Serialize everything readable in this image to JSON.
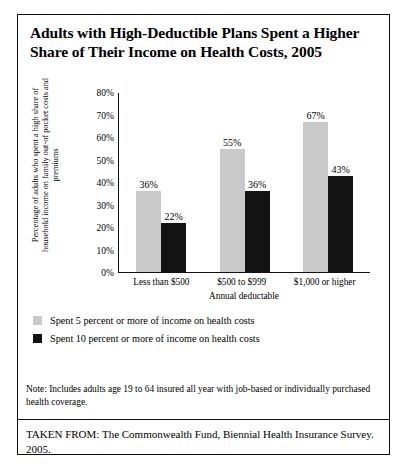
{
  "title": "Adults with High-Deductible Plans Spent a Higher Share of Their Income on Health Costs, 2005",
  "note": "Note: Includes adults age 19 to 64 insured all year with job-based or individually purchased health coverage.",
  "source": "TAKEN FROM: The Commonwealth Fund, Biennial Health Insurance Survey. 2005.",
  "legend": [
    {
      "label": "Spent 5 percent or more of income on health costs",
      "color": "#c9c9c9"
    },
    {
      "label": "Spent 10 percent or more of income on health costs",
      "color": "#131313"
    }
  ],
  "chart_data": {
    "type": "bar",
    "title": "Adults with High-Deductible Plans Spent a Higher Share of Their Income on Health Costs, 2005",
    "xlabel": "Annual deductable",
    "ylabel": "Percentage of adults who spent a high share of household income on family out-of pocket costs and premiums",
    "categories": [
      "Less than $500",
      "$500 to $999",
      "$1,000 or higher"
    ],
    "series": [
      {
        "name": "Spent 5 percent or more of income on health costs",
        "color": "#c9c9c9",
        "values": [
          36,
          55,
          67
        ],
        "labels": [
          "36%",
          "55%",
          "67%"
        ]
      },
      {
        "name": "Spent 10 percent or more of income on health costs",
        "color": "#131313",
        "values": [
          22,
          36,
          43
        ],
        "labels": [
          "22%",
          "36%",
          "43%"
        ]
      }
    ],
    "ylim": [
      0,
      80
    ],
    "yticks": [
      80,
      70,
      60,
      50,
      40,
      30,
      20,
      10,
      0
    ],
    "yticklabels": [
      "80%",
      "70%",
      "60%",
      "50%",
      "40%",
      "30%",
      "20%",
      "10%",
      "0%"
    ],
    "grid": false,
    "legend_position": "below-plot-left"
  }
}
